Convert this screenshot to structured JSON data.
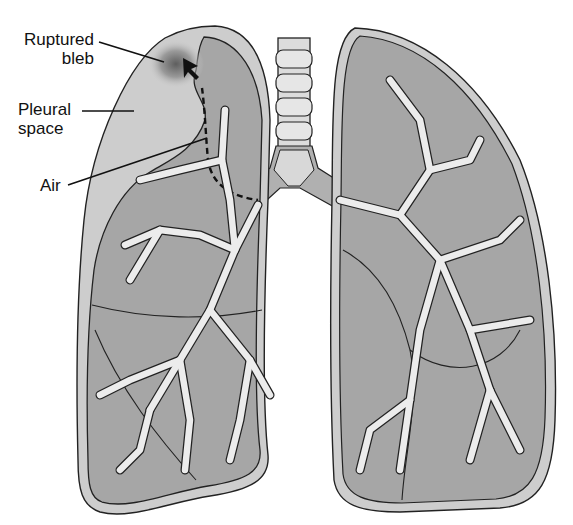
{
  "diagram": {
    "colors": {
      "background": "#ffffff",
      "pleural_space": "#cdcdcd",
      "lung_tissue": "#a6a6a6",
      "airway": "#ececec",
      "outline": "#222222",
      "bleb_shadow": "#6a6a6a"
    },
    "labels": [
      {
        "id": "ruptured-bleb",
        "line1": "Ruptured",
        "line2": "bleb"
      },
      {
        "id": "pleural-space",
        "line1": "Pleural",
        "line2": "space"
      },
      {
        "id": "air",
        "line1": "Air"
      }
    ]
  }
}
